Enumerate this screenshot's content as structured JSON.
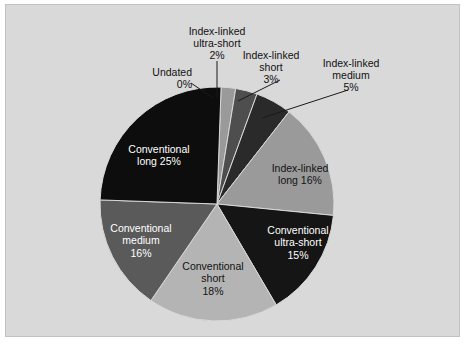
{
  "chart_data": {
    "type": "pie",
    "title": "",
    "xlabel": "",
    "ylabel": "",
    "legend_position": "none",
    "grid": false,
    "label_format": "name + percent",
    "start_angle_deg": 0,
    "direction": "clockwise",
    "categories": [
      "Undated",
      "Index-linked ultra-short",
      "Index-linked short",
      "Index-linked medium",
      "Index-linked long",
      "Conventional ultra-short",
      "Conventional short",
      "Conventional medium",
      "Conventional long"
    ],
    "values": [
      0,
      2,
      3,
      5,
      16,
      15,
      18,
      16,
      25
    ],
    "units": "percent",
    "colors": [
      "#fdfdfd",
      "#9a9a9a",
      "#4e4e4e",
      "#2a2a2a",
      "#9a9a9a",
      "#151515",
      "#b4b4b4",
      "#5a5a5a",
      "#0d0d0d"
    ],
    "slices": [
      {
        "name": "Undated",
        "value": 0,
        "label": "Undated",
        "percent": "0%",
        "color": "#fdfdfd",
        "label_placement": "callout"
      },
      {
        "name": "Index-linked ultra-short",
        "value": 2,
        "label_line1": "Index-linked",
        "label_line2": "ultra-short",
        "percent": "2%",
        "color": "#9a9a9a",
        "label_placement": "callout"
      },
      {
        "name": "Index-linked short",
        "value": 3,
        "label_line1": "Index-linked",
        "label_line2": "short",
        "percent": "3%",
        "color": "#4e4e4e",
        "label_placement": "callout"
      },
      {
        "name": "Index-linked medium",
        "value": 5,
        "label_line1": "Index-linked",
        "label_line2": "medium",
        "percent": "5%",
        "color": "#2a2a2a",
        "label_placement": "callout"
      },
      {
        "name": "Index-linked long",
        "value": 16,
        "label_line1": "Index-linked",
        "label_line2": "long 16%",
        "percent": "16%",
        "color": "#9a9a9a",
        "label_placement": "inside"
      },
      {
        "name": "Conventional ultra-short",
        "value": 15,
        "label_line1": "Conventional",
        "label_line2": "ultra-short",
        "label_line3": "15%",
        "percent": "15%",
        "color": "#151515",
        "label_placement": "inside"
      },
      {
        "name": "Conventional short",
        "value": 18,
        "label_line1": "Conventional",
        "label_line2": "short",
        "label_line3": "18%",
        "percent": "18%",
        "color": "#b4b4b4",
        "label_placement": "inside"
      },
      {
        "name": "Conventional medium",
        "value": 16,
        "label_line1": "Conventional",
        "label_line2": "medium",
        "label_line3": "16%",
        "percent": "16%",
        "color": "#5a5a5a",
        "label_placement": "inside"
      },
      {
        "name": "Conventional long",
        "value": 25,
        "label_line1": "Conventional",
        "label_line2": "long 25%",
        "percent": "25%",
        "color": "#0d0d0d",
        "label_placement": "inside"
      }
    ]
  },
  "figure": {
    "background": "#d9d9d9",
    "border_color": "#c2c2c2",
    "leader_line_color": "#1a1a1a"
  },
  "callouts": {
    "undated": {
      "line1": "Undated",
      "pct": "0%"
    },
    "il_ultra_short": {
      "line1": "Index-linked",
      "line2": "ultra-short",
      "pct": "2%"
    },
    "il_short": {
      "line1": "Index-linked",
      "line2": "short",
      "pct": "3%"
    },
    "il_medium": {
      "line1": "Index-linked",
      "line2": "medium",
      "pct": "5%"
    }
  },
  "inside_labels": {
    "conv_long": {
      "line1": "Conventional",
      "line2": "long 25%"
    },
    "il_long": {
      "line1": "Index-linked",
      "line2": "long 16%"
    },
    "conv_ultra_short": {
      "line1": "Conventional",
      "line2": "ultra-short",
      "line3": "15%"
    },
    "conv_short": {
      "line1": "Conventional",
      "line2": "short",
      "line3": "18%"
    },
    "conv_medium": {
      "line1": "Conventional",
      "line2": "medium",
      "line3": "16%"
    }
  }
}
